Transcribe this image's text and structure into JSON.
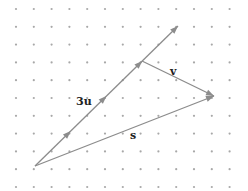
{
  "diagram": {
    "title": "",
    "colors": {
      "background": "#ffffff",
      "dots": "#a8a8a8",
      "vectors": "#8c8c8c",
      "labels": "#222222"
    },
    "grid": {
      "x0": 16,
      "y0": 9,
      "spacing": 17.8,
      "cols": 13,
      "rows": 11
    },
    "vectors": [
      {
        "name": "3u",
        "label": "3u",
        "from": [
          35,
          166
        ],
        "to": [
          178,
          26
        ],
        "arrowheads_at_fraction": [
          0.25,
          0.5,
          0.75,
          1.0
        ]
      },
      {
        "name": "v",
        "label": "v",
        "from": [
          142,
          61
        ],
        "to": [
          214,
          96
        ]
      },
      {
        "name": "s",
        "label": "s",
        "from": [
          35,
          166
        ],
        "to": [
          214,
          96
        ]
      }
    ],
    "labels": {
      "u": "3u",
      "v": "v",
      "s": "s"
    }
  }
}
